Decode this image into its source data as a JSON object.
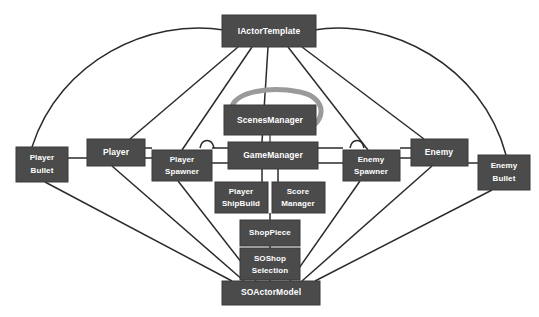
{
  "diagram": {
    "type": "class-dependency-graph",
    "background_color": "#ffffff",
    "node_fill": "#4b4b4b",
    "node_text_color": "#ffffff",
    "edge_color": "#2b2b2b",
    "selfloop_color": "#9a9a9a",
    "nodes": [
      {
        "id": "iactortemplate",
        "label": "IActorTemplate",
        "line1": "IActorTemplate",
        "line2": "",
        "x": 222,
        "y": 15,
        "w": 94,
        "h": 32
      },
      {
        "id": "scenesmanager",
        "label": "ScenesManager",
        "line1": "ScenesManager",
        "line2": "",
        "x": 224,
        "y": 105,
        "w": 92,
        "h": 30
      },
      {
        "id": "gamemanager",
        "label": "GameManager",
        "line1": "GameManager",
        "line2": "",
        "x": 228,
        "y": 142,
        "w": 90,
        "h": 27
      },
      {
        "id": "player",
        "label": "Player",
        "line1": "Player",
        "line2": "",
        "x": 87,
        "y": 139,
        "w": 58,
        "h": 27
      },
      {
        "id": "playerbullet",
        "label": "Player Bullet",
        "line1": "Player",
        "line2": "Bullet",
        "x": 16,
        "y": 147,
        "w": 52,
        "h": 35
      },
      {
        "id": "playerspawner",
        "label": "Player Spawner",
        "line1": "Player",
        "line2": "Spawner",
        "x": 152,
        "y": 150,
        "w": 60,
        "h": 31
      },
      {
        "id": "enemy",
        "label": "Enemy",
        "line1": "Enemy",
        "line2": "",
        "x": 411,
        "y": 139,
        "w": 57,
        "h": 27
      },
      {
        "id": "enemyspawner",
        "label": "Enemy Spawner",
        "line1": "Enemy",
        "line2": "Spawner",
        "x": 343,
        "y": 150,
        "w": 57,
        "h": 31
      },
      {
        "id": "enemybullet",
        "label": "Enemy Bullet",
        "line1": "Enemy",
        "line2": "Bullet",
        "x": 478,
        "y": 155,
        "w": 52,
        "h": 35
      },
      {
        "id": "playershipbuild",
        "label": "Player ShipBuild",
        "line1": "Player",
        "line2": "ShipBuild",
        "x": 215,
        "y": 182,
        "w": 53,
        "h": 31
      },
      {
        "id": "scoremanager",
        "label": "Score Manager",
        "line1": "Score",
        "line2": "Manager",
        "x": 272,
        "y": 182,
        "w": 53,
        "h": 31
      },
      {
        "id": "shoppiece",
        "label": "ShopPiece",
        "line1": "ShopPiece",
        "line2": "",
        "x": 240,
        "y": 220,
        "w": 60,
        "h": 26
      },
      {
        "id": "soshopselection",
        "label": "SOShop Selection",
        "line1": "SOShop",
        "line2": "Selection",
        "x": 240,
        "y": 248,
        "w": 60,
        "h": 32
      },
      {
        "id": "soactormodel",
        "label": "SOActorModel",
        "line1": "SOActorModel",
        "line2": "",
        "x": 222,
        "y": 281,
        "w": 98,
        "h": 24
      }
    ],
    "edges": [
      {
        "from": "iactortemplate",
        "to": "playerbullet",
        "kind": "arc-left"
      },
      {
        "from": "iactortemplate",
        "to": "enemybullet",
        "kind": "arc-right"
      },
      {
        "from": "iactortemplate",
        "to": "player",
        "kind": "line"
      },
      {
        "from": "iactortemplate",
        "to": "playerspawner",
        "kind": "line"
      },
      {
        "from": "iactortemplate",
        "to": "gamemanager",
        "kind": "line"
      },
      {
        "from": "iactortemplate",
        "to": "enemyspawner",
        "kind": "line"
      },
      {
        "from": "iactortemplate",
        "to": "enemy",
        "kind": "line"
      },
      {
        "from": "scenesmanager",
        "to": "scenesmanager",
        "kind": "self-loop"
      },
      {
        "from": "scenesmanager",
        "to": "gamemanager",
        "kind": "line"
      },
      {
        "from": "gamemanager",
        "to": "player",
        "kind": "line"
      },
      {
        "from": "gamemanager",
        "to": "playerspawner",
        "kind": "line"
      },
      {
        "from": "gamemanager",
        "to": "enemy",
        "kind": "line"
      },
      {
        "from": "gamemanager",
        "to": "enemyspawner",
        "kind": "line"
      },
      {
        "from": "gamemanager",
        "to": "playershipbuild",
        "kind": "line"
      },
      {
        "from": "gamemanager",
        "to": "scoremanager",
        "kind": "line"
      },
      {
        "from": "gamemanager",
        "to": "shoppiece",
        "kind": "line"
      },
      {
        "from": "player",
        "to": "playerbullet",
        "kind": "line"
      },
      {
        "from": "player",
        "to": "playerspawner",
        "kind": "line"
      },
      {
        "from": "enemy",
        "to": "enemybullet",
        "kind": "line"
      },
      {
        "from": "enemy",
        "to": "enemyspawner",
        "kind": "line"
      },
      {
        "from": "shoppiece",
        "to": "soshopselection",
        "kind": "line"
      },
      {
        "from": "soshopselection",
        "to": "soactormodel",
        "kind": "line"
      },
      {
        "from": "soactormodel",
        "to": "playerbullet",
        "kind": "line"
      },
      {
        "from": "soactormodel",
        "to": "player",
        "kind": "line"
      },
      {
        "from": "soactormodel",
        "to": "playerspawner",
        "kind": "line"
      },
      {
        "from": "soactormodel",
        "to": "enemyspawner",
        "kind": "line"
      },
      {
        "from": "soactormodel",
        "to": "enemy",
        "kind": "line"
      },
      {
        "from": "soactormodel",
        "to": "enemybullet",
        "kind": "line"
      }
    ]
  }
}
